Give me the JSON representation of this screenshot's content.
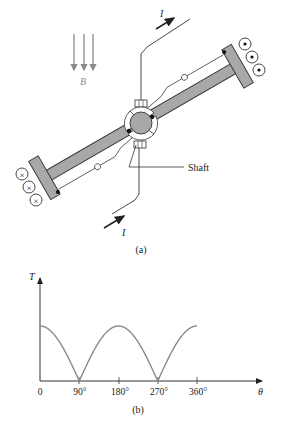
{
  "figure_a": {
    "caption": "(a)",
    "field_label": "B",
    "current_label_top": "I",
    "current_label_bottom": "I",
    "shaft_label": "Shaft",
    "conductors_left_symbol": "×",
    "conductors_right_symbol": "•",
    "colors": {
      "rotor_fill": "#a8a8a8",
      "field_arrows": "#8a8a8a",
      "line": "#333333"
    }
  },
  "figure_b": {
    "caption": "(b)",
    "y_axis_label": "T",
    "x_axis_label": "θ",
    "x_ticks": [
      "0",
      "90°",
      "180°",
      "270°",
      "360°"
    ]
  },
  "chart_data": {
    "type": "line",
    "title": "",
    "xlabel": "θ",
    "ylabel": "T",
    "x": [
      0,
      15,
      30,
      45,
      60,
      75,
      90,
      105,
      120,
      135,
      150,
      165,
      180,
      195,
      210,
      225,
      240,
      255,
      270,
      285,
      300,
      315,
      330,
      345,
      360
    ],
    "series": [
      {
        "name": "T(θ) = |cos θ|",
        "values": [
          1.0,
          0.966,
          0.866,
          0.707,
          0.5,
          0.259,
          0.0,
          0.259,
          0.5,
          0.707,
          0.866,
          0.966,
          1.0,
          0.966,
          0.866,
          0.707,
          0.5,
          0.259,
          0.0,
          0.259,
          0.5,
          0.707,
          0.866,
          0.966,
          1.0
        ]
      }
    ],
    "x_tick_labels": [
      "0",
      "90°",
      "180°",
      "270°",
      "360°"
    ],
    "xlim": [
      0,
      360
    ],
    "ylim": [
      0,
      1.6
    ],
    "grid": false,
    "legend": "none",
    "line_color": "#8a8a8a"
  }
}
